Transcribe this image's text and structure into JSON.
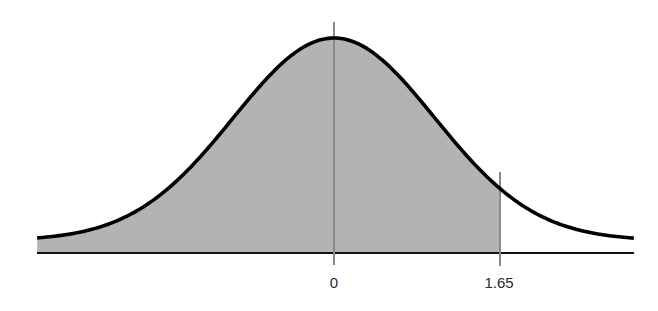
{
  "chart_data": {
    "type": "area",
    "title": "",
    "subtitle": "",
    "xlabel": "",
    "ylabel": "",
    "distribution": {
      "name": "standard normal",
      "mean": 0,
      "sd": 1
    },
    "xlim": [
      -2.95,
      2.98
    ],
    "shaded_region": {
      "from": -2.95,
      "to": 1.65
    },
    "vertical_lines": [
      {
        "x": 0,
        "label": "0"
      },
      {
        "x": 1.65,
        "label": "1.65"
      }
    ],
    "tick_labels": [
      "0",
      "1.65"
    ],
    "grid": false,
    "legend": null,
    "colors": {
      "curve": "#000000",
      "fill": "#b3b3b3",
      "axis": "#111111",
      "marker_lines": "#8a8a8a",
      "labels": "#2a2a2a"
    }
  },
  "labels": {
    "zero": "0",
    "critical": "1.65"
  }
}
